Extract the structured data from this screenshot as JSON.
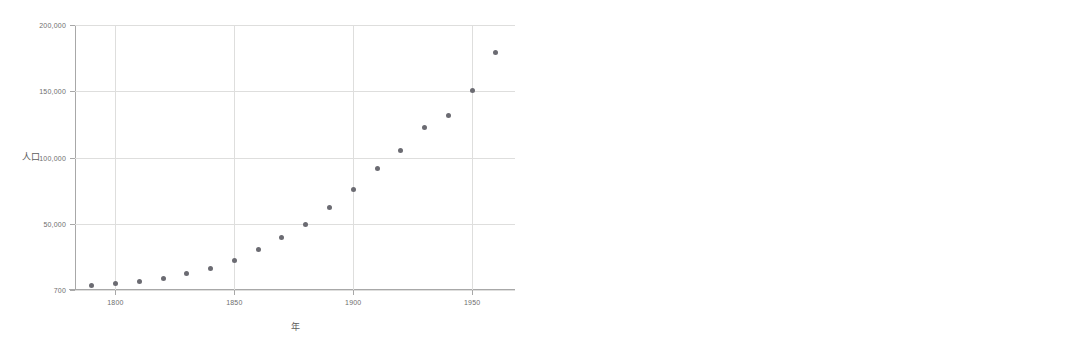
{
  "chart_data": [
    {
      "id": "population-scatter",
      "type": "scatter",
      "title": "",
      "xlabel": "年",
      "ylabel": "人口",
      "xtick_labels": [
        "1800",
        "1850",
        "1900",
        "1950"
      ],
      "xticks": [
        1800,
        1850,
        1900,
        1950
      ],
      "ytick_labels": [
        "700",
        "50,000",
        "100,000",
        "150,000",
        "200,000"
      ],
      "yticks": [
        700,
        50000,
        100000,
        150000,
        200000
      ],
      "xlim": [
        1783,
        1968
      ],
      "ylim": [
        700,
        200000
      ],
      "grid": true,
      "legend": "none",
      "marker": "filled-circle",
      "marker_color": "#6b6b72",
      "x": [
        1790,
        1800,
        1810,
        1820,
        1830,
        1840,
        1850,
        1860,
        1870,
        1880,
        1890,
        1900,
        1910,
        1920,
        1930,
        1940,
        1950,
        1960
      ],
      "y": [
        3929,
        5308,
        7240,
        9638,
        12866,
        17069,
        23192,
        31443,
        39818,
        50156,
        62948,
        75995,
        91972,
        105711,
        122775,
        131669,
        150697,
        179323
      ],
      "points": [
        {
          "x": 1790,
          "y": 3929
        },
        {
          "x": 1800,
          "y": 5308
        },
        {
          "x": 1810,
          "y": 7240
        },
        {
          "x": 1820,
          "y": 9638
        },
        {
          "x": 1830,
          "y": 12866
        },
        {
          "x": 1840,
          "y": 17069
        },
        {
          "x": 1850,
          "y": 23192
        },
        {
          "x": 1860,
          "y": 31443
        },
        {
          "x": 1870,
          "y": 39818
        },
        {
          "x": 1880,
          "y": 50156
        },
        {
          "x": 1890,
          "y": 62948
        },
        {
          "x": 1900,
          "y": 75995
        },
        {
          "x": 1910,
          "y": 91972
        },
        {
          "x": 1920,
          "y": 105711
        },
        {
          "x": 1930,
          "y": 122775
        },
        {
          "x": 1940,
          "y": 131669
        },
        {
          "x": 1950,
          "y": 150697
        },
        {
          "x": 1960,
          "y": 179323
        }
      ]
    },
    {
      "id": "residuals-scatter",
      "type": "scatter",
      "title": "",
      "xlabel": "年",
      "ylabel": "Residuals",
      "xtick_labels": [
        "1800",
        "1850",
        "1900",
        "1950"
      ],
      "xticks": [
        1800,
        1850,
        1900,
        1950
      ],
      "ytick_labels": [
        "10.00",
        "5.00",
        ".00",
        "-5.00",
        "-10.00"
      ],
      "yticks": [
        10,
        5,
        0,
        -5,
        -10
      ],
      "xlim": [
        1783,
        1968
      ],
      "ylim": [
        -11.5,
        11.5
      ],
      "grid": true,
      "legend": "none",
      "marker": "filled-circle",
      "marker_color": "#6b6b72",
      "x": [
        1790,
        1800,
        1810,
        1820,
        1830,
        1840,
        1850,
        1860,
        1870,
        1880,
        1890,
        1900,
        1910,
        1920,
        1930,
        1940,
        1950,
        1960
      ],
      "y": [
        -0.62,
        -0.68,
        -0.85,
        -1.05,
        -1.1,
        -1.22,
        -0.65,
        0.55,
        -0.35,
        0.85,
        1.75,
        2.55,
        2.1,
        2.9,
        4.15,
        -8.45,
        -0.05,
        7.5
      ],
      "points": [
        {
          "x": 1790,
          "y": -0.62
        },
        {
          "x": 1800,
          "y": -0.68
        },
        {
          "x": 1810,
          "y": -0.85
        },
        {
          "x": 1820,
          "y": -1.05
        },
        {
          "x": 1830,
          "y": -1.1
        },
        {
          "x": 1840,
          "y": -1.22
        },
        {
          "x": 1850,
          "y": -0.65
        },
        {
          "x": 1860,
          "y": 0.55
        },
        {
          "x": 1870,
          "y": -0.35
        },
        {
          "x": 1880,
          "y": 0.85
        },
        {
          "x": 1890,
          "y": 1.75
        },
        {
          "x": 1900,
          "y": 2.55
        },
        {
          "x": 1910,
          "y": 2.1
        },
        {
          "x": 1920,
          "y": 2.9
        },
        {
          "x": 1930,
          "y": 4.15
        },
        {
          "x": 1940,
          "y": -8.45
        },
        {
          "x": 1950,
          "y": -0.05
        },
        {
          "x": 1960,
          "y": 7.5
        }
      ]
    }
  ]
}
